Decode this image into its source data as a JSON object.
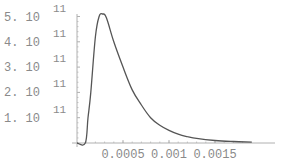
{
  "chart_data": {
    "type": "line",
    "title": "",
    "xlabel": "",
    "ylabel": "",
    "xlim": [
      0,
      0.0019
    ],
    "ylim": [
      0,
      530000000000
    ],
    "grid": false,
    "legend": null,
    "x_ticks": [
      0.0005,
      0.001,
      0.0015
    ],
    "x_tick_labels": [
      "0.0005",
      "0.001",
      "0.0015"
    ],
    "y_ticks": [
      100000000000,
      200000000000,
      300000000000,
      400000000000,
      500000000000
    ],
    "y_tick_labels": [
      {
        "mantissa": "1.",
        "base": "10",
        "exponent": "11"
      },
      {
        "mantissa": "2.",
        "base": "10",
        "exponent": "11"
      },
      {
        "mantissa": "3.",
        "base": "10",
        "exponent": "11"
      },
      {
        "mantissa": "4.",
        "base": "10",
        "exponent": "11"
      },
      {
        "mantissa": "5.",
        "base": "10",
        "exponent": "11"
      }
    ],
    "series": [
      {
        "name": "curve",
        "color": "#555555",
        "x": [
          0,
          9e-05,
          0.00012,
          0.00015,
          0.0002,
          0.00024,
          0.00028,
          0.00032,
          0.0004,
          0.0005,
          0.0006,
          0.0007,
          0.0008,
          0.0009,
          0.001,
          0.0011,
          0.0012,
          0.0013,
          0.0015,
          0.0017,
          0.0019
        ],
        "y": [
          0,
          0,
          100000000000,
          200000000000,
          420000000000,
          500000000000,
          510000000000,
          495000000000,
          400000000000,
          300000000000,
          210000000000,
          150000000000,
          100000000000,
          70000000000,
          50000000000,
          35000000000,
          25000000000,
          18000000000,
          10000000000,
          6000000000,
          3000000000
        ]
      }
    ]
  },
  "colors": {
    "axis": "#b0b0b0",
    "curve": "#555555",
    "label": "#8a8a8a"
  }
}
